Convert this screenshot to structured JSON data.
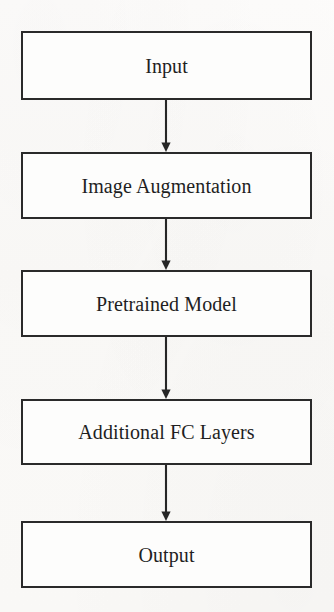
{
  "diagram": {
    "type": "vertical-flowchart",
    "canvas": {
      "width": 334,
      "height": 612
    },
    "style": {
      "background_color": "#fbfaf8",
      "box_fill_color": "#fdfdfc",
      "box_border_color": "#2a2a2a",
      "text_color": "#1f1f1f",
      "arrow_color": "#262626"
    },
    "nodes": [
      {
        "id": "input",
        "label": "Input",
        "x": 21,
        "y": 31,
        "width": 291,
        "height": 69
      },
      {
        "id": "image-augmentation",
        "label": "Image Augmentation",
        "x": 21,
        "y": 152,
        "width": 291,
        "height": 67
      },
      {
        "id": "pretrained-model",
        "label": "Pretrained Model",
        "x": 21,
        "y": 270,
        "width": 291,
        "height": 67
      },
      {
        "id": "additional-fc-layers",
        "label": "Additional FC Layers",
        "x": 21,
        "y": 399,
        "width": 291,
        "height": 66
      },
      {
        "id": "output",
        "label": "Output",
        "x": 21,
        "y": 521,
        "width": 291,
        "height": 67
      }
    ],
    "edges": [
      {
        "id": "edge-input-to-augmentation",
        "from": "input",
        "to": "image-augmentation",
        "x": 166,
        "y_start": 100,
        "y_end": 152,
        "arrowhead": "solid-triangle"
      },
      {
        "id": "edge-augmentation-to-pretrained",
        "from": "image-augmentation",
        "to": "pretrained-model",
        "x": 166,
        "y_start": 219,
        "y_end": 270,
        "arrowhead": "solid-triangle"
      },
      {
        "id": "edge-pretrained-to-fc",
        "from": "pretrained-model",
        "to": "additional-fc-layers",
        "x": 166,
        "y_start": 337,
        "y_end": 399,
        "arrowhead": "solid-triangle"
      },
      {
        "id": "edge-fc-to-output",
        "from": "additional-fc-layers",
        "to": "output",
        "x": 166,
        "y_start": 465,
        "y_end": 521,
        "arrowhead": "solid-triangle"
      }
    ]
  }
}
